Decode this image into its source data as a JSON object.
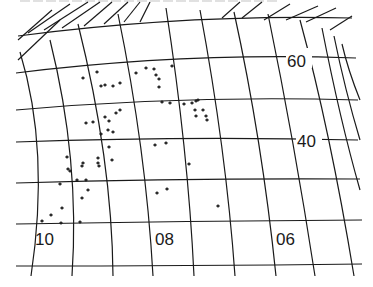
{
  "map": {
    "type": "celestial-chart-graticule",
    "colors": {
      "ink": "#1a1a1a",
      "background": "#ffffff"
    },
    "labels": {
      "dec_60": "60",
      "dec_40": "40",
      "ra_10": "10",
      "ra_08": "08",
      "ra_06": "06"
    },
    "parallels": [
      {
        "name": "top",
        "path": "M 18 36 Q 185 14 352 18"
      },
      {
        "name": "p60",
        "path": "M 16 73 Q 185 52 356 58"
      },
      {
        "name": "p50",
        "path": "M 16 110 Q 185 95 358 100"
      },
      {
        "name": "p40",
        "path": "M 16 142 Q 185 136 358 140"
      },
      {
        "name": "p30",
        "path": "M 16 183 Q 185 178 360 179"
      },
      {
        "name": "p20",
        "path": "M 16 224 Q 185 221 362 220"
      },
      {
        "name": "p10",
        "path": "M 16 266 Q 185 266 362 264"
      }
    ],
    "meridians": [
      {
        "path": "M 31 276 Q 50 150 20 52"
      },
      {
        "path": "M 72 276 Q 80 160 50 40"
      },
      {
        "path": "M 113 276 Q 112 160 78 24"
      },
      {
        "path": "M 153 276 Q 146 150 118 14"
      },
      {
        "path": "M 194 276 Q 188 150 166 8"
      },
      {
        "path": "M 235 276 Q 226 150 200 10"
      },
      {
        "path": "M 276 276 Q 262 140 234 12"
      },
      {
        "path": "M 315 276 Q 294 140 268 14"
      },
      {
        "path": "M 354 276 Q 330 130 300 20"
      },
      {
        "path": "M 360 190 Q 340 120 322 28"
      },
      {
        "path": "M 360 140 Q 345 90 334 36"
      },
      {
        "path": "M 360 100 Q 348 70 342 44"
      }
    ],
    "left_fan": [
      {
        "path": "M 18 40 L 52 10"
      },
      {
        "path": "M 18 60 L 60 20"
      },
      {
        "path": "M 28 33 L 70 4"
      },
      {
        "path": "M 44 30 L 88 2"
      },
      {
        "path": "M 62 28 L 100 2"
      },
      {
        "path": "M 84 26 L 112 2"
      },
      {
        "path": "M 104 24 L 128 2"
      },
      {
        "path": "M 124 22 L 140 2"
      },
      {
        "path": "M 140 22 L 150 2"
      }
    ],
    "right_fan": [
      {
        "path": "M 222 18 L 240 2"
      },
      {
        "path": "M 242 18 L 262 2"
      },
      {
        "path": "M 264 20 L 290 4"
      },
      {
        "path": "M 286 20 L 318 6"
      },
      {
        "path": "M 306 22 L 336 8"
      },
      {
        "path": "M 330 30 L 352 16"
      }
    ],
    "stars": [
      [
        83,
        78
      ],
      [
        97,
        72
      ],
      [
        101,
        86
      ],
      [
        105,
        85
      ],
      [
        113,
        86
      ],
      [
        120,
        83
      ],
      [
        136,
        73
      ],
      [
        146,
        68
      ],
      [
        154,
        69
      ],
      [
        156,
        75
      ],
      [
        159,
        79
      ],
      [
        159,
        87
      ],
      [
        172,
        66
      ],
      [
        162,
        102
      ],
      [
        170,
        103
      ],
      [
        184,
        104
      ],
      [
        192,
        103
      ],
      [
        196,
        101
      ],
      [
        198,
        100
      ],
      [
        195,
        110
      ],
      [
        203,
        110
      ],
      [
        196,
        116
      ],
      [
        206,
        116
      ],
      [
        207,
        120
      ],
      [
        86,
        123
      ],
      [
        93,
        122
      ],
      [
        105,
        117
      ],
      [
        109,
        121
      ],
      [
        116,
        113
      ],
      [
        120,
        110
      ],
      [
        101,
        134
      ],
      [
        108,
        130
      ],
      [
        113,
        132
      ],
      [
        109,
        147
      ],
      [
        166,
        143
      ],
      [
        155,
        145
      ],
      [
        98,
        158
      ],
      [
        98,
        163
      ],
      [
        99,
        166
      ],
      [
        112,
        160
      ],
      [
        67,
        157
      ],
      [
        68,
        169
      ],
      [
        70,
        171
      ],
      [
        83,
        163
      ],
      [
        82,
        166
      ],
      [
        77,
        180
      ],
      [
        86,
        180
      ],
      [
        60,
        184
      ],
      [
        88,
        190
      ],
      [
        82,
        198
      ],
      [
        189,
        164
      ],
      [
        157,
        193
      ],
      [
        167,
        189
      ],
      [
        218,
        206
      ],
      [
        62,
        208
      ],
      [
        51,
        215
      ],
      [
        42,
        221
      ],
      [
        61,
        223
      ],
      [
        80,
        222
      ]
    ]
  }
}
